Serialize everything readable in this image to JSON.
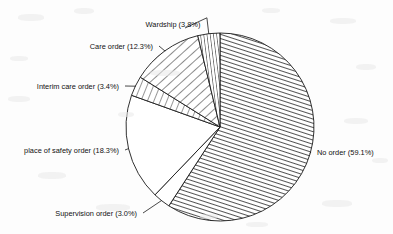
{
  "chart_data": {
    "type": "pie",
    "title": "",
    "subtitle": "",
    "xlabel": "",
    "ylabel": "",
    "legend_position": "none",
    "grid": false,
    "start_angle_deg": 0,
    "direction": "clockwise",
    "units": "percent",
    "total": 99.9,
    "categories": [
      "No order",
      "Supervision order",
      "place of safety order",
      "Interim care order",
      "Care order",
      "Wardship"
    ],
    "values": [
      59.1,
      3.0,
      18.3,
      3.4,
      12.3,
      3.8
    ],
    "labels": [
      "No order (59.1%)",
      "Supervision order (3.0%)",
      "place of safety order (18.3%)",
      "Interim care order (3.4%)",
      "Care order (12.3%)",
      "Wardship (3.8%)"
    ],
    "slices": [
      {
        "name": "No order",
        "value": 59.1,
        "value_text": "59.1%",
        "label": "No order (59.1%)",
        "fill": "diagonal-hatch-dense",
        "fill_color": "#ffffff",
        "stroke_color": "#1a1a1a",
        "label_anchor": "right",
        "label_x": 317,
        "label_y": 155
      },
      {
        "name": "Supervision order",
        "value": 3.0,
        "value_text": "3.0%",
        "label": "Supervision order (3.0%)",
        "fill": "blank",
        "fill_color": "#ffffff",
        "stroke_color": "#1a1a1a",
        "label_anchor": "end",
        "label_x": 137,
        "label_y": 216
      },
      {
        "name": "place of safety order",
        "value": 18.3,
        "value_text": "18.3%",
        "label": "place of safety order (18.3%)",
        "fill": "blank",
        "fill_color": "#ffffff",
        "stroke_color": "#1a1a1a",
        "label_anchor": "end",
        "label_x": 119,
        "label_y": 153
      },
      {
        "name": "Interim care order",
        "value": 3.4,
        "value_text": "3.4%",
        "label": "Interim care order (3.4%)",
        "fill": "horizontal-hatch-sparse",
        "fill_color": "#ffffff",
        "stroke_color": "#1a1a1a",
        "label_anchor": "end",
        "label_x": 119,
        "label_y": 89
      },
      {
        "name": "Care order",
        "value": 12.3,
        "value_text": "12.3%",
        "label": "Care order (12.3%)",
        "fill": "diagonal-hatch-wide",
        "fill_color": "#ffffff",
        "stroke_color": "#1a1a1a",
        "label_anchor": "end",
        "label_x": 153,
        "label_y": 49
      },
      {
        "name": "Wardship",
        "value": 3.8,
        "value_text": "3.8%",
        "label": "Wardship (3.8%)",
        "fill": "vertical-hatch",
        "fill_color": "#ffffff",
        "stroke_color": "#1a1a1a",
        "label_anchor": "middle",
        "label_x": 173,
        "label_y": 27
      }
    ],
    "geometry": {
      "center_x": 220,
      "center_y": 127,
      "radius": 94
    },
    "colors": {
      "background": "#fdfdfd",
      "line": "#1a1a1a",
      "text": "#111111"
    }
  }
}
